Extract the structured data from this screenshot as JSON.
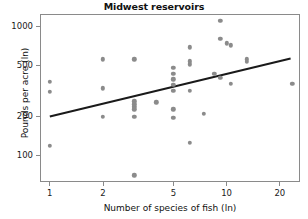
{
  "chart_data": {
    "type": "scatter",
    "title": "Midwest reservoirs",
    "xlabel": "Number of species of fish (ln)",
    "ylabel": "Pounds per acre (ln)",
    "xscale": "log",
    "yscale": "log",
    "xlim": [
      0.88,
      26
    ],
    "ylim": [
      62,
      1250
    ],
    "grid": false,
    "legend": null,
    "xticks": [
      1,
      2,
      5,
      10,
      20
    ],
    "xtick_labels": [
      "1",
      "2",
      "5",
      "10",
      "20"
    ],
    "yticks": [
      100,
      200,
      500,
      1000
    ],
    "ytick_labels": [
      "100",
      "200",
      "500",
      "1000"
    ],
    "marker_color": "#8b8b8b",
    "line_color": "#1a1a1a",
    "points": [
      {
        "x": 1.0,
        "y": 370
      },
      {
        "x": 1.0,
        "y": 310
      },
      {
        "x": 1.0,
        "y": 118
      },
      {
        "x": 2.0,
        "y": 555
      },
      {
        "x": 2.0,
        "y": 330
      },
      {
        "x": 2.0,
        "y": 200
      },
      {
        "x": 3.0,
        "y": 555
      },
      {
        "x": 3.0,
        "y": 262
      },
      {
        "x": 3.0,
        "y": 248
      },
      {
        "x": 3.0,
        "y": 238
      },
      {
        "x": 3.0,
        "y": 228
      },
      {
        "x": 3.0,
        "y": 200
      },
      {
        "x": 3.0,
        "y": 70
      },
      {
        "x": 4.0,
        "y": 258
      },
      {
        "x": 5.0,
        "y": 478
      },
      {
        "x": 5.0,
        "y": 430
      },
      {
        "x": 5.0,
        "y": 388
      },
      {
        "x": 5.0,
        "y": 352
      },
      {
        "x": 5.0,
        "y": 318
      },
      {
        "x": 5.0,
        "y": 228
      },
      {
        "x": 5.0,
        "y": 195
      },
      {
        "x": 6.2,
        "y": 690
      },
      {
        "x": 6.2,
        "y": 538
      },
      {
        "x": 6.2,
        "y": 508
      },
      {
        "x": 6.2,
        "y": 318
      },
      {
        "x": 6.2,
        "y": 125
      },
      {
        "x": 7.4,
        "y": 210
      },
      {
        "x": 8.5,
        "y": 428
      },
      {
        "x": 9.2,
        "y": 1110
      },
      {
        "x": 9.2,
        "y": 800
      },
      {
        "x": 9.2,
        "y": 398
      },
      {
        "x": 10.0,
        "y": 742
      },
      {
        "x": 10.6,
        "y": 715
      },
      {
        "x": 10.6,
        "y": 358
      },
      {
        "x": 13.0,
        "y": 558
      },
      {
        "x": 13.0,
        "y": 530
      },
      {
        "x": 23.5,
        "y": 358
      }
    ],
    "trendline": {
      "description": "least-squares fit line",
      "x_start": 1.0,
      "y_start": 200,
      "x_end": 23.0,
      "y_end": 565
    }
  }
}
